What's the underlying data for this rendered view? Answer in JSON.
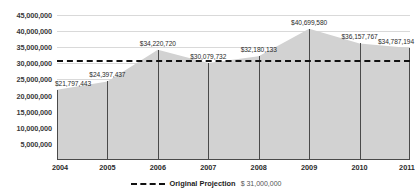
{
  "chart_data": {
    "type": "area",
    "title": "",
    "xlabel": "",
    "ylabel": "",
    "categories": [
      "2004",
      "2005",
      "2006",
      "2007",
      "2008",
      "2009",
      "2010",
      "2011"
    ],
    "values": [
      21797443,
      24397437,
      34220720,
      30079732,
      32180133,
      40699580,
      36157767,
      34787194
    ],
    "point_labels": [
      "$21,797,443",
      "$24,397,437",
      "$34,220,720",
      "$30,079,732",
      "$32,180,133",
      "$40,699,580",
      "$36,157,767",
      "$34,787,194"
    ],
    "ylim": [
      0,
      45000000
    ],
    "yticks": [
      45000000,
      40000000,
      35000000,
      30000000,
      25000000,
      20000000,
      15000000,
      10000000,
      5000000
    ],
    "ytick_labels": [
      "45,000,000",
      "40,000,000",
      "35,000,000",
      "30,000,000",
      "25,000,000",
      "20,000,000",
      "15,000,000",
      "10,000,000",
      "5,000,000"
    ],
    "grid": true,
    "legend_position": "bottom-center",
    "series": [
      {
        "name": "Actual",
        "kind": "area",
        "fill_color": "#d2d2d2",
        "values": [
          21797443,
          24397437,
          34220720,
          30079732,
          32180133,
          40699580,
          36157767,
          34787194
        ]
      },
      {
        "name": "Original Projection",
        "kind": "threshold-line",
        "style": "dashed",
        "color": "#111111",
        "value": 31000000
      }
    ],
    "annotations": []
  },
  "legend": {
    "label": "Original Projection",
    "value": "$ 31,000,000"
  },
  "colors": {
    "area_fill": "#d2d2d2",
    "gridline": "#d9d9d9",
    "axis_line": "#4a4a4a",
    "projection_line": "#111111",
    "label_text": "#2b2b2b"
  }
}
